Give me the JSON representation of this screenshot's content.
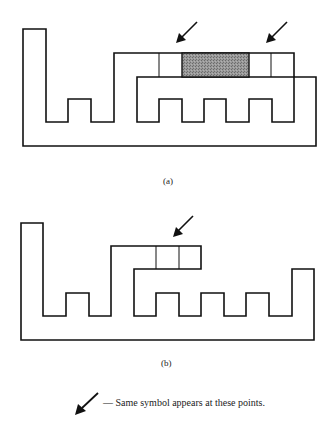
{
  "figure_a": {
    "caption": "(a)",
    "shaded_color": "#8a8a8a",
    "arrow_count": 2
  },
  "figure_b": {
    "caption": "(b)",
    "arrow_count": 1
  },
  "legend": {
    "symbol": "arrow-icon",
    "text": "— Same symbol appears at these points."
  }
}
